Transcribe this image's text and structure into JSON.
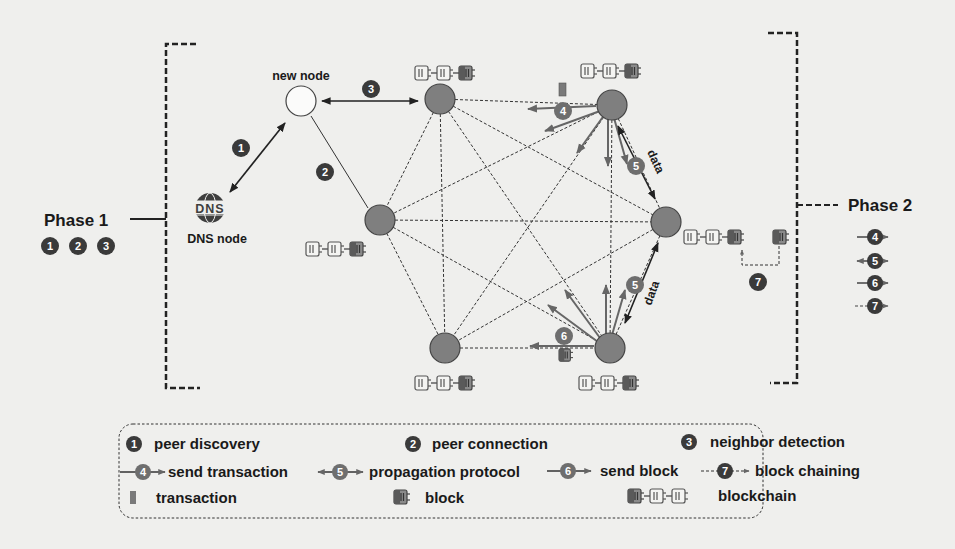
{
  "colors": {
    "background": "#efefed",
    "node_fill": "#7f7f7f",
    "node_stroke": "#444444",
    "badge_fill": "#3a3a3a",
    "badge_fill_light": "#6e6e6e",
    "line": "#333333",
    "text": "#1a1a1a"
  },
  "phases": {
    "phase1": {
      "label": "Phase 1",
      "badges": [
        "1",
        "2",
        "3"
      ]
    },
    "phase2": {
      "label": "Phase 2",
      "badges": [
        "4",
        "5",
        "6",
        "7"
      ]
    }
  },
  "nodes": {
    "new_node": {
      "label": "new node"
    },
    "dns_node": {
      "label": "DNS node",
      "icon_text": "DNS"
    }
  },
  "diagram_labels": {
    "step1": "1",
    "step2": "2",
    "step3": "3",
    "step4": "4",
    "step5a": "5",
    "step5b": "5",
    "step6": "6",
    "step7": "7",
    "data_a": "data",
    "data_b": "data"
  },
  "legend": {
    "row1": [
      {
        "badge": "1",
        "label": "peer discovery"
      },
      {
        "badge": "2",
        "label": "peer connection"
      },
      {
        "badge": "3",
        "label": "neighbor detection"
      }
    ],
    "row2": [
      {
        "badge": "4",
        "label": "send transaction"
      },
      {
        "badge": "5",
        "label": "propagation protocol"
      },
      {
        "badge": "6",
        "label": "send block"
      },
      {
        "badge": "7",
        "label": "block chaining"
      }
    ],
    "row3": [
      {
        "icon": "transaction-icon",
        "label": "transaction"
      },
      {
        "icon": "block-icon",
        "label": "block"
      },
      {
        "icon": "blockchain-icon",
        "label": "blockchain"
      }
    ]
  }
}
